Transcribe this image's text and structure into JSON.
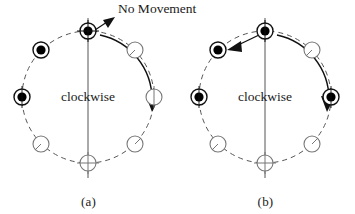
{
  "figure": {
    "background_color": "#ffffff",
    "stroke_color": "#111111",
    "dashed_color": "#555555",
    "open_node_color": "#777777",
    "filled_node_color": "#000000",
    "annotation_no_movement": "No Movement",
    "panels": [
      {
        "id": "a",
        "caption": "(a)",
        "rotation_label": "clockwise",
        "center": {
          "x": 88,
          "y": 97
        },
        "radius": 66,
        "axis": {
          "x": 88,
          "y1": 18,
          "y2": 178
        },
        "nodes": [
          {
            "position": "12:00",
            "angle_deg": -90,
            "state": "filled"
          },
          {
            "position": "1:30",
            "angle_deg": -45,
            "state": "open"
          },
          {
            "position": "3:00",
            "angle_deg": 0,
            "state": "open"
          },
          {
            "position": "4:30",
            "angle_deg": 45,
            "state": "open"
          },
          {
            "position": "6:00",
            "angle_deg": 90,
            "state": "open"
          },
          {
            "position": "7:30",
            "angle_deg": 135,
            "state": "open"
          },
          {
            "position": "9:00",
            "angle_deg": 180,
            "state": "filled"
          },
          {
            "position": "10:30",
            "angle_deg": -135,
            "state": "filled"
          }
        ],
        "straight_arrow": {
          "from": "12:00",
          "to": "up-right",
          "meaning": "no-movement"
        },
        "curved_arrow": {
          "from_angle_deg": -80,
          "to_angle_deg": 5,
          "direction": "clockwise"
        }
      },
      {
        "id": "b",
        "caption": "(b)",
        "rotation_label": "clockwise",
        "center": {
          "x": 88,
          "y": 97
        },
        "radius": 66,
        "axis": {
          "x": 88,
          "y1": 18,
          "y2": 178
        },
        "nodes": [
          {
            "position": "12:00",
            "angle_deg": -90,
            "state": "filled"
          },
          {
            "position": "1:30",
            "angle_deg": -45,
            "state": "open"
          },
          {
            "position": "3:00",
            "angle_deg": 0,
            "state": "filled"
          },
          {
            "position": "4:30",
            "angle_deg": 45,
            "state": "open"
          },
          {
            "position": "6:00",
            "angle_deg": 90,
            "state": "open"
          },
          {
            "position": "7:30",
            "angle_deg": 135,
            "state": "open"
          },
          {
            "position": "9:00",
            "angle_deg": 180,
            "state": "filled"
          },
          {
            "position": "10:30",
            "angle_deg": -135,
            "state": "filled"
          }
        ],
        "straight_arrow": {
          "from": "12:00",
          "to": "10:30",
          "meaning": "transfer"
        },
        "curved_arrow": {
          "from_angle_deg": -80,
          "to_angle_deg": 5,
          "direction": "clockwise"
        }
      }
    ]
  }
}
